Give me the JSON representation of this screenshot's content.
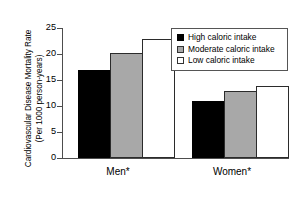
{
  "chart_data": {
    "type": "bar",
    "title": "",
    "xlabel": "",
    "ylabel": "Cardiovascular Disease Mortality Rate (Per 1000 person-years)",
    "ylabel_line1": "Cardiovascular Disease Mortality Rate",
    "ylabel_line2": "(Per 1000 person-years)",
    "categories": [
      "Men*",
      "Women*"
    ],
    "series": [
      {
        "name": "High caloric intake",
        "color": "#000000",
        "values": [
          17.0,
          11.0
        ]
      },
      {
        "name": "Moderate caloric intake",
        "color": "#a8a8a8",
        "values": [
          20.1,
          12.9
        ]
      },
      {
        "name": "Low caloric intake",
        "color": "#ffffff",
        "values": [
          22.8,
          13.8
        ]
      }
    ],
    "ylim": [
      0,
      25
    ],
    "yticks": [
      0,
      5,
      10,
      15,
      20,
      25
    ],
    "ytick_labels": [
      "0",
      "5",
      "10",
      "15",
      "20",
      "25"
    ],
    "grid": false,
    "legend_position": "top-right",
    "legend_entries": [
      {
        "label": "High caloric intake",
        "swatch": "black"
      },
      {
        "label": "Moderate caloric intake",
        "swatch": "gray"
      },
      {
        "label": "Low caloric intake",
        "swatch": "white"
      }
    ]
  }
}
